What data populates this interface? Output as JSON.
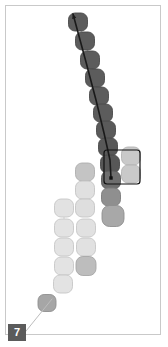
{
  "panel": {
    "label": "7",
    "width": 168,
    "height": 347,
    "background": "#ffffff",
    "border_color": "#c9c9c9",
    "label_background": "#5b5b5b",
    "label_text_color": "#ffffff"
  },
  "chart_data": {
    "type": "scatter",
    "title": "",
    "subtitle": "",
    "xlabel": "",
    "ylabel": "",
    "xlim": [
      0,
      168
    ],
    "ylim": [
      0,
      347
    ],
    "grid": false,
    "legend": null,
    "annotations": [
      {
        "name": "trajectory-arrow",
        "type": "arrow",
        "color": "#1a1a1a",
        "width": 1.6,
        "points": [
          [
            73,
            14
          ],
          [
            86,
            62
          ],
          [
            96,
            100
          ],
          [
            104,
            133
          ],
          [
            110,
            160
          ],
          [
            111,
            178
          ]
        ],
        "head_at": [
          73,
          14
        ],
        "head_size": 5
      },
      {
        "name": "selection-rectangle",
        "type": "rect",
        "color": "#111111",
        "width": 1.2,
        "x": 104,
        "y": 150,
        "w": 36,
        "h": 34,
        "rx": 3
      },
      {
        "name": "track-endpoint-marker",
        "type": "square-marker",
        "color": "#111111",
        "x": 111,
        "y": 178,
        "size": 3.4
      },
      {
        "name": "lower-connector-line",
        "type": "line",
        "color": "#bdbdbd",
        "width": 1.0,
        "points": [
          [
            22,
            336
          ],
          [
            52,
            299
          ]
        ]
      }
    ],
    "cells": [
      {
        "id": 1,
        "cx": 78,
        "cy": 22,
        "w": 19,
        "h": 18,
        "fill": "#5c5c5c",
        "stroke": "#4a4a4a"
      },
      {
        "id": 2,
        "cx": 85,
        "cy": 41,
        "w": 19,
        "h": 18,
        "fill": "#5c5c5c",
        "stroke": "#4a4a4a"
      },
      {
        "id": 3,
        "cx": 90,
        "cy": 60,
        "w": 19,
        "h": 18,
        "fill": "#5c5c5c",
        "stroke": "#4a4a4a"
      },
      {
        "id": 4,
        "cx": 95,
        "cy": 78,
        "w": 19,
        "h": 18,
        "fill": "#5c5c5c",
        "stroke": "#4a4a4a"
      },
      {
        "id": 5,
        "cx": 99,
        "cy": 96,
        "w": 19,
        "h": 18,
        "fill": "#5c5c5c",
        "stroke": "#4a4a4a"
      },
      {
        "id": 6,
        "cx": 103,
        "cy": 113,
        "w": 19,
        "h": 18,
        "fill": "#5c5c5c",
        "stroke": "#4a4a4a"
      },
      {
        "id": 7,
        "cx": 106,
        "cy": 130,
        "w": 19,
        "h": 18,
        "fill": "#5a5a5a",
        "stroke": "#4a4a4a"
      },
      {
        "id": 8,
        "cx": 108,
        "cy": 147,
        "w": 19,
        "h": 18,
        "fill": "#585858",
        "stroke": "#4a4a4a"
      },
      {
        "id": 9,
        "cx": 110,
        "cy": 164,
        "w": 19,
        "h": 18,
        "fill": "#575757",
        "stroke": "#4a4a4a"
      },
      {
        "id": 10,
        "cx": 111,
        "cy": 180,
        "w": 19,
        "h": 18,
        "fill": "#6e6e6e",
        "stroke": "#5a5a5a"
      },
      {
        "id": 11,
        "cx": 111,
        "cy": 197,
        "w": 19,
        "h": 18,
        "fill": "#8f8f8f",
        "stroke": "#7a7a7a"
      },
      {
        "id": 12,
        "cx": 113,
        "cy": 216,
        "w": 22,
        "h": 21,
        "fill": "#a8a8a8",
        "stroke": "#8f8f8f"
      },
      {
        "id": 13,
        "cx": 131,
        "cy": 156,
        "w": 19,
        "h": 18,
        "fill": "#c9c9c9",
        "stroke": "#b3b3b3"
      },
      {
        "id": 14,
        "cx": 131,
        "cy": 174,
        "w": 19,
        "h": 18,
        "fill": "#c9c9c9",
        "stroke": "#b3b3b3"
      },
      {
        "id": 15,
        "cx": 85,
        "cy": 172,
        "w": 19,
        "h": 18,
        "fill": "#c4c4c4",
        "stroke": "#aeaeae"
      },
      {
        "id": 16,
        "cx": 85,
        "cy": 190,
        "w": 19,
        "h": 18,
        "fill": "#e0e0e0",
        "stroke": "#c4c4c4"
      },
      {
        "id": 17,
        "cx": 85,
        "cy": 208,
        "w": 19,
        "h": 18,
        "fill": "#dedede",
        "stroke": "#c4c4c4"
      },
      {
        "id": 18,
        "cx": 64,
        "cy": 208,
        "w": 19,
        "h": 18,
        "fill": "#e2e2e2",
        "stroke": "#c6c6c6"
      },
      {
        "id": 19,
        "cx": 64,
        "cy": 228,
        "w": 19,
        "h": 18,
        "fill": "#e3e3e3",
        "stroke": "#c6c6c6"
      },
      {
        "id": 20,
        "cx": 86,
        "cy": 228,
        "w": 19,
        "h": 18,
        "fill": "#e1e1e1",
        "stroke": "#c6c6c6"
      },
      {
        "id": 21,
        "cx": 64,
        "cy": 247,
        "w": 19,
        "h": 18,
        "fill": "#e3e3e3",
        "stroke": "#c6c6c6"
      },
      {
        "id": 22,
        "cx": 86,
        "cy": 247,
        "w": 19,
        "h": 18,
        "fill": "#e1e1e1",
        "stroke": "#c6c6c6"
      },
      {
        "id": 23,
        "cx": 64,
        "cy": 266,
        "w": 19,
        "h": 18,
        "fill": "#e3e3e3",
        "stroke": "#c6c6c6"
      },
      {
        "id": 24,
        "cx": 86,
        "cy": 266,
        "w": 20,
        "h": 19,
        "fill": "#bdbdbd",
        "stroke": "#a6a6a6"
      },
      {
        "id": 25,
        "cx": 63,
        "cy": 284,
        "w": 19,
        "h": 18,
        "fill": "#e3e3e3",
        "stroke": "#c6c6c6"
      },
      {
        "id": 26,
        "cx": 47,
        "cy": 303,
        "w": 18,
        "h": 17,
        "fill": "#a6a6a6",
        "stroke": "#8f8f8f"
      }
    ]
  }
}
